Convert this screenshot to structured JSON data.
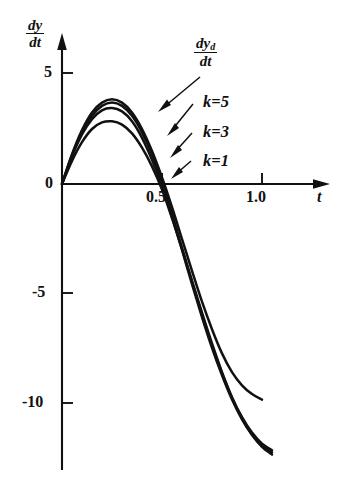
{
  "figure": {
    "background": "#ffffff",
    "ink_color": "#111111"
  },
  "axes": {
    "y_label_numerator": "dy",
    "y_label_denominator": "dt",
    "x_label": "t",
    "y_ticks": [
      "5",
      "0",
      "-5",
      "-10"
    ],
    "y_tick_values": [
      5,
      0,
      -5,
      -10
    ],
    "x_ticks": [
      "0.5",
      "1.0"
    ],
    "x_tick_values": [
      0.5,
      1.0
    ],
    "x_range": [
      -0.05,
      1.3
    ],
    "y_range": [
      -13.5,
      6.5
    ]
  },
  "annotations": {
    "desired": {
      "numerator": "dy",
      "numerator_sub": "d",
      "denominator": "dt"
    },
    "k5": "k=5",
    "k3": "k=3",
    "k1": "k=1"
  },
  "chart_data": {
    "type": "line",
    "title": "",
    "xlabel": "t",
    "ylabel": "dy/dt",
    "xlim": [
      -0.05,
      1.3
    ],
    "ylim": [
      -13.5,
      6.5
    ],
    "grid": false,
    "legend": "inline-annotations",
    "xticks": [
      0.5,
      1.0
    ],
    "yticks": [
      5,
      0,
      -5,
      -10
    ],
    "annotations": [
      {
        "text": "dy_d/dt",
        "points_to_series": "dy_d/dt (desired)"
      },
      {
        "text": "k=5",
        "points_to_series": "k=5"
      },
      {
        "text": "k=3",
        "points_to_series": "k=3"
      },
      {
        "text": "k=1",
        "points_to_series": "k=1"
      }
    ],
    "series": [
      {
        "name": "dy_d/dt (desired)",
        "x": [
          0.0,
          0.05,
          0.1,
          0.15,
          0.2,
          0.25,
          0.3,
          0.35,
          0.4,
          0.45,
          0.5,
          0.55,
          0.6,
          0.65,
          0.7,
          0.75,
          0.8,
          0.85,
          0.9,
          0.95,
          1.0
        ],
        "y": [
          0.0,
          1.35,
          2.45,
          3.25,
          3.7,
          3.85,
          3.7,
          3.25,
          2.5,
          1.5,
          0.3,
          -1.05,
          -2.5,
          -3.95,
          -5.35,
          -6.6,
          -7.7,
          -8.55,
          -9.15,
          -9.55,
          -9.8
        ]
      },
      {
        "name": "k=5",
        "x": [
          0.0,
          0.05,
          0.1,
          0.15,
          0.2,
          0.25,
          0.3,
          0.35,
          0.4,
          0.45,
          0.5,
          0.55,
          0.6,
          0.65,
          0.7,
          0.75,
          0.8,
          0.85,
          0.9,
          0.95,
          1.0,
          1.05
        ],
        "y": [
          0.0,
          1.3,
          2.35,
          3.1,
          3.55,
          3.7,
          3.55,
          3.1,
          2.35,
          1.35,
          0.1,
          -1.35,
          -2.9,
          -4.45,
          -5.95,
          -7.35,
          -8.6,
          -9.7,
          -10.6,
          -11.3,
          -11.8,
          -12.1
        ]
      },
      {
        "name": "k=3",
        "x": [
          0.0,
          0.05,
          0.1,
          0.15,
          0.2,
          0.25,
          0.3,
          0.35,
          0.4,
          0.45,
          0.5,
          0.55,
          0.6,
          0.65,
          0.7,
          0.75,
          0.8,
          0.85,
          0.9,
          0.95,
          1.0,
          1.05
        ],
        "y": [
          0.0,
          1.25,
          2.25,
          2.95,
          3.35,
          3.45,
          3.3,
          2.85,
          2.1,
          1.1,
          -0.1,
          -1.5,
          -3.0,
          -4.55,
          -6.05,
          -7.45,
          -8.7,
          -9.8,
          -10.7,
          -11.4,
          -11.9,
          -12.2
        ]
      },
      {
        "name": "k=1",
        "x": [
          0.0,
          0.05,
          0.1,
          0.15,
          0.2,
          0.25,
          0.3,
          0.35,
          0.4,
          0.45,
          0.5,
          0.55,
          0.6,
          0.65,
          0.7,
          0.75,
          0.8,
          0.85,
          0.9,
          0.95,
          1.0,
          1.05
        ],
        "y": [
          0.0,
          1.05,
          1.9,
          2.5,
          2.8,
          2.85,
          2.7,
          2.3,
          1.65,
          0.8,
          -0.25,
          -1.55,
          -2.95,
          -4.4,
          -5.85,
          -7.25,
          -8.55,
          -9.7,
          -10.65,
          -11.4,
          -11.95,
          -12.3
        ]
      }
    ]
  }
}
